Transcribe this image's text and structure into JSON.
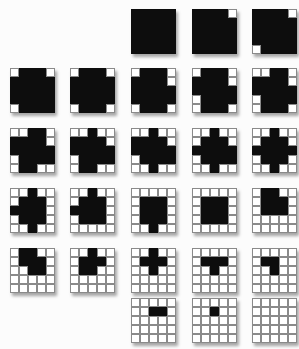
{
  "figure": {
    "description_name": "progressive-whitening-square-sequence",
    "grid_size": 5,
    "colors": {
      "black": "#0d0d0d",
      "white": "#ffffff",
      "gridline": "#8a8a8a",
      "background": "#fcfcfc",
      "shadow": "rgba(0,0,0,0.35)"
    },
    "squares": [
      {
        "row": 0,
        "col": 2,
        "white_count": 0,
        "pattern": "1111111111111111111111111"
      },
      {
        "row": 0,
        "col": 3,
        "white_count": 1,
        "pattern": "1111011111111111111111111"
      },
      {
        "row": 0,
        "col": 4,
        "white_count": 2,
        "pattern": "1111011111111111111101111"
      },
      {
        "row": 1,
        "col": 0,
        "white_count": 3,
        "pattern": "0111011111111111111101111"
      },
      {
        "row": 1,
        "col": 1,
        "white_count": 4,
        "pattern": "0111011111111111111101110"
      },
      {
        "row": 1,
        "col": 2,
        "white_count": 5,
        "pattern": "0111011110111111111101110"
      },
      {
        "row": 1,
        "col": 3,
        "white_count": 6,
        "pattern": "0111011110111110111101110"
      },
      {
        "row": 1,
        "col": 4,
        "white_count": 7,
        "pattern": "0011011110111110111101110"
      },
      {
        "row": 2,
        "col": 0,
        "white_count": 8,
        "pattern": "0011011110111110111101100"
      },
      {
        "row": 2,
        "col": 1,
        "white_count": 9,
        "pattern": "0010011110111110111101100"
      },
      {
        "row": 2,
        "col": 2,
        "white_count": 10,
        "pattern": "0010011110111110111100100"
      },
      {
        "row": 2,
        "col": 3,
        "white_count": 11,
        "pattern": "0010001110111110111100100"
      },
      {
        "row": 2,
        "col": 4,
        "white_count": 12,
        "pattern": "0010001110111110111000100"
      },
      {
        "row": 3,
        "col": 0,
        "white_count": 13,
        "pattern": "0010001110111100111000100"
      },
      {
        "row": 3,
        "col": 1,
        "white_count": 14,
        "pattern": "0010001110111100111000000"
      },
      {
        "row": 3,
        "col": 2,
        "white_count": 15,
        "pattern": "0000001110011100111000100"
      },
      {
        "row": 3,
        "col": 3,
        "white_count": 16,
        "pattern": "0000001110011100111000000"
      },
      {
        "row": 3,
        "col": 4,
        "white_count": 17,
        "pattern": "0110001110011100000000000"
      },
      {
        "row": 4,
        "col": 0,
        "white_count": 18,
        "pattern": "0110001110001100000000000"
      },
      {
        "row": 4,
        "col": 1,
        "white_count": 19,
        "pattern": "0010001110011000000000000"
      },
      {
        "row": 4,
        "col": 2,
        "white_count": 20,
        "pattern": "0010001110001000000000000"
      },
      {
        "row": 4,
        "col": 3,
        "white_count": 21,
        "pattern": "0000001110001000000000000"
      },
      {
        "row": 4,
        "col": 4,
        "white_count": 22,
        "pattern": "0000001100001000000000000"
      },
      {
        "row": 5,
        "col": 2,
        "white_count": 23,
        "pattern": "0000000110000000000000000"
      },
      {
        "row": 5,
        "col": 3,
        "white_count": 24,
        "pattern": "0000000100000000000000000"
      },
      {
        "row": 5,
        "col": 4,
        "white_count": 25,
        "pattern": "0000000000000000000000000"
      }
    ]
  }
}
